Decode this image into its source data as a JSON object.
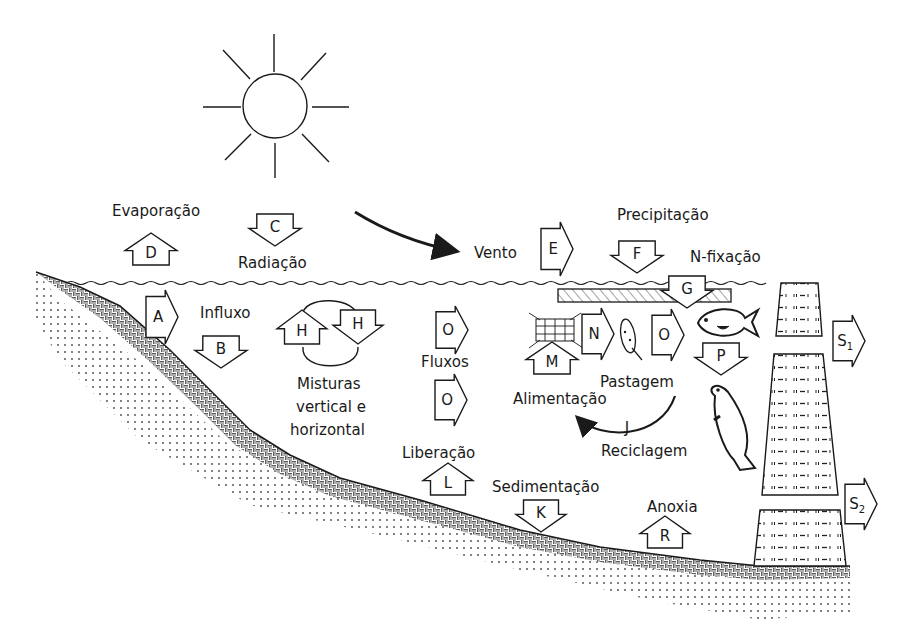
{
  "diagram": {
    "labels": {
      "evaporacao": "Evaporação",
      "radiacao": "Radiação",
      "vento": "Vento",
      "precipitacao": "Precipitação",
      "n_fixacao": "N-fixação",
      "influxo": "Influxo",
      "misturas_1": "Misturas",
      "misturas_2": "vertical e",
      "misturas_3": "horizontal",
      "fluxos": "Fluxos",
      "liberacao": "Liberação",
      "sedimentacao": "Sedimentação",
      "alimentacao": "Alimentação",
      "pastagem": "Pastagem",
      "reciclagem": "Reciclagem",
      "anoxia": "Anoxia"
    },
    "arrows": {
      "A": {
        "letter": "A",
        "direction": "right",
        "meaning": "Influxo"
      },
      "B": {
        "letter": "B",
        "direction": "down",
        "meaning": "Influxo"
      },
      "C": {
        "letter": "C",
        "direction": "down",
        "meaning": "Radiação"
      },
      "D": {
        "letter": "D",
        "direction": "up",
        "meaning": "Evaporação"
      },
      "E": {
        "letter": "E",
        "direction": "right",
        "meaning": "Vento"
      },
      "F": {
        "letter": "F",
        "direction": "down",
        "meaning": "Precipitação"
      },
      "G": {
        "letter": "G",
        "direction": "down",
        "meaning": "N-fixação"
      },
      "H1": {
        "letter": "H",
        "direction": "up",
        "meaning": "Misturas vertical e horizontal"
      },
      "H2": {
        "letter": "H",
        "direction": "down",
        "meaning": "Misturas vertical e horizontal"
      },
      "O1": {
        "letter": "O",
        "direction": "right",
        "meaning": "Fluxos"
      },
      "O2": {
        "letter": "O",
        "direction": "right",
        "meaning": "Fluxos"
      },
      "O3": {
        "letter": "O",
        "direction": "right",
        "meaning": "Pastagem"
      },
      "L": {
        "letter": "L",
        "direction": "up",
        "meaning": "Liberação"
      },
      "K": {
        "letter": "K",
        "direction": "down",
        "meaning": "Sedimentação"
      },
      "M": {
        "letter": "M",
        "direction": "up",
        "meaning": "Alimentação"
      },
      "N": {
        "letter": "N",
        "direction": "right",
        "meaning": "Pastagem"
      },
      "P": {
        "letter": "P",
        "direction": "down",
        "meaning": "Predação"
      },
      "J": {
        "letter": "J",
        "direction": "curved-left",
        "meaning": "Reciclagem"
      },
      "R": {
        "letter": "R",
        "direction": "up",
        "meaning": "Anoxia"
      },
      "S1": {
        "letter": "S",
        "subscript": "1",
        "direction": "right"
      },
      "S2": {
        "letter": "S",
        "subscript": "2",
        "direction": "right"
      }
    },
    "icons": [
      "sun-icon",
      "phytoplankton-icon",
      "zooplankton-icon",
      "small-fish-icon",
      "large-fish-icon",
      "dam-icon",
      "wind-arrow-icon",
      "recycling-arrow-icon"
    ],
    "colors": {
      "ink": "#1a1a1a",
      "background": "#ffffff"
    }
  }
}
